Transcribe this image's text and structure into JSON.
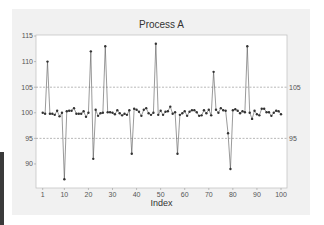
{
  "chart_data": {
    "type": "line",
    "title": "Process A",
    "xlabel": "Index",
    "ylabel": "",
    "xlim": [
      1,
      100
    ],
    "ylim": [
      85.3,
      115.2
    ],
    "x_ticks": [
      1,
      10,
      20,
      30,
      40,
      50,
      60,
      70,
      80,
      90,
      100
    ],
    "y_ticks": [
      90,
      95,
      100,
      105,
      110,
      115
    ],
    "reference_lines": [
      {
        "value": 105,
        "label": "105",
        "style": "dashed"
      },
      {
        "value": 95,
        "label": "95",
        "style": "dashed"
      }
    ],
    "grid": false,
    "legend": "none",
    "marker": "circle",
    "colors": {
      "line": "#555555",
      "marker": "#333333",
      "refline": "#888888",
      "plot_bg": "#ffffff",
      "frame_bg": "#f1f1f1"
    },
    "series": [
      {
        "name": "Process A",
        "x": [
          1,
          2,
          3,
          4,
          5,
          6,
          7,
          8,
          9,
          10,
          11,
          12,
          13,
          14,
          15,
          16,
          17,
          18,
          19,
          20,
          21,
          22,
          23,
          24,
          25,
          26,
          27,
          28,
          29,
          30,
          31,
          32,
          33,
          34,
          35,
          36,
          37,
          38,
          39,
          40,
          41,
          42,
          43,
          44,
          45,
          46,
          47,
          48,
          49,
          50,
          51,
          52,
          53,
          54,
          55,
          56,
          57,
          58,
          59,
          60,
          61,
          62,
          63,
          64,
          65,
          66,
          67,
          68,
          69,
          70,
          71,
          72,
          73,
          74,
          75,
          76,
          77,
          78,
          79,
          80,
          81,
          82,
          83,
          84,
          85,
          86,
          87,
          88,
          89,
          90,
          91,
          92,
          93,
          94,
          95,
          96,
          97,
          98,
          99,
          100
        ],
        "values": [
          100.0,
          99.8,
          110.0,
          99.8,
          99.8,
          99.6,
          100.4,
          99.3,
          100.0,
          87.0,
          100.3,
          100.4,
          100.4,
          100.9,
          99.8,
          99.8,
          99.8,
          100.3,
          99.2,
          100.0,
          112.0,
          91.0,
          100.6,
          99.4,
          99.9,
          100.0,
          113.0,
          100.1,
          100.1,
          100.0,
          99.7,
          100.5,
          99.9,
          99.5,
          99.8,
          99.6,
          100.5,
          92.0,
          100.8,
          100.6,
          100.2,
          99.4,
          100.6,
          100.9,
          99.9,
          99.6,
          100.0,
          113.5,
          99.6,
          100.4,
          99.6,
          100.2,
          100.3,
          101.2,
          99.8,
          100.1,
          92.0,
          99.6,
          99.9,
          100.3,
          99.4,
          100.2,
          100.5,
          100.5,
          100.1,
          99.4,
          99.5,
          100.5,
          99.9,
          100.6,
          99.5,
          108.0,
          100.6,
          100.0,
          100.9,
          100.5,
          100.4,
          96.0,
          89.0,
          100.5,
          100.7,
          100.4,
          99.9,
          100.3,
          100.1,
          113.0,
          100.0,
          98.8,
          100.4,
          99.7,
          99.5,
          100.8,
          100.8,
          100.1,
          100.1,
          99.4,
          100.0,
          100.4,
          100.3,
          99.7
        ]
      }
    ]
  }
}
